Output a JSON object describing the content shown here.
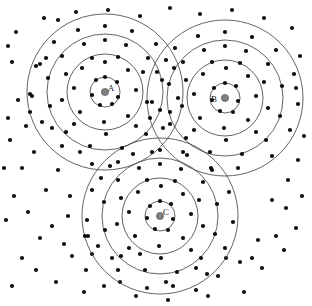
{
  "figure": {
    "width": 312,
    "height": 306,
    "background_color": "#ffffff",
    "ring_stroke_color": "#3c3c3c",
    "point_color": "#111111",
    "centroid_color": "#808080"
  },
  "chart_data": {
    "type": "scatter",
    "title": "",
    "xlabel": "",
    "ylabel": "",
    "xlim": [
      0,
      312
    ],
    "ylim": [
      0,
      306
    ],
    "grid": false,
    "legend": "none",
    "annotations": [
      "A",
      "B",
      "C"
    ],
    "clusters": [
      {
        "label": "A",
        "center": [
          105,
          92
        ],
        "centroid_color": "#808080",
        "centroid_radius": 3.6,
        "label_offset": [
          6,
          -3
        ],
        "ring_radii": [
          15,
          38,
          58,
          78
        ]
      },
      {
        "label": "B",
        "center": [
          225,
          98
        ],
        "centroid_color": "#808080",
        "centroid_radius": 3.6,
        "label_offset": [
          -11,
          2
        ],
        "ring_radii": [
          15,
          38,
          58,
          78
        ]
      },
      {
        "label": "C",
        "center": [
          160,
          216
        ],
        "centroid_color": "#808080",
        "centroid_radius": 3.6,
        "label_offset": [
          6,
          -3
        ],
        "ring_radii": [
          15,
          38,
          58,
          78
        ]
      }
    ],
    "cluster_points": {
      "A": [
        [
          105,
          77
        ],
        [
          96,
          80
        ],
        [
          117,
          82
        ],
        [
          92,
          95
        ],
        [
          118,
          97
        ],
        [
          100,
          105
        ],
        [
          112,
          104
        ],
        [
          82,
          68
        ],
        [
          105,
          62
        ],
        [
          128,
          70
        ],
        [
          74,
          88
        ],
        [
          136,
          90
        ],
        [
          80,
          112
        ],
        [
          104,
          122
        ],
        [
          128,
          116
        ],
        [
          92,
          58
        ],
        [
          118,
          57
        ],
        [
          66,
          74
        ],
        [
          143,
          72
        ],
        [
          62,
          100
        ],
        [
          147,
          102
        ],
        [
          74,
          124
        ],
        [
          106,
          134
        ],
        [
          136,
          126
        ],
        [
          105,
          40
        ],
        [
          84,
          44
        ],
        [
          126,
          45
        ],
        [
          62,
          56
        ],
        [
          148,
          58
        ],
        [
          48,
          78
        ],
        [
          162,
          80
        ],
        [
          50,
          106
        ],
        [
          160,
          110
        ],
        [
          66,
          132
        ],
        [
          146,
          134
        ],
        [
          90,
          146
        ],
        [
          122,
          148
        ],
        [
          105,
          26
        ],
        [
          78,
          30
        ],
        [
          132,
          31
        ],
        [
          54,
          42
        ],
        [
          156,
          44
        ],
        [
          36,
          66
        ],
        [
          174,
          68
        ],
        [
          32,
          96
        ],
        [
          178,
          98
        ],
        [
          42,
          122
        ],
        [
          170,
          124
        ],
        [
          62,
          146
        ],
        [
          152,
          152
        ],
        [
          92,
          164
        ],
        [
          118,
          162
        ],
        [
          30,
          112
        ],
        [
          46,
          58
        ]
      ],
      "B": [
        [
          225,
          83
        ],
        [
          214,
          88
        ],
        [
          236,
          86
        ],
        [
          212,
          100
        ],
        [
          238,
          101
        ],
        [
          220,
          111
        ],
        [
          233,
          112
        ],
        [
          203,
          74
        ],
        [
          226,
          68
        ],
        [
          248,
          76
        ],
        [
          194,
          94
        ],
        [
          256,
          96
        ],
        [
          200,
          118
        ],
        [
          224,
          128
        ],
        [
          248,
          120
        ],
        [
          212,
          62
        ],
        [
          240,
          63
        ],
        [
          186,
          80
        ],
        [
          264,
          82
        ],
        [
          182,
          106
        ],
        [
          268,
          108
        ],
        [
          194,
          130
        ],
        [
          226,
          140
        ],
        [
          256,
          132
        ],
        [
          225,
          46
        ],
        [
          204,
          50
        ],
        [
          246,
          51
        ],
        [
          183,
          62
        ],
        [
          268,
          64
        ],
        [
          169,
          84
        ],
        [
          282,
          86
        ],
        [
          170,
          112
        ],
        [
          280,
          116
        ],
        [
          186,
          138
        ],
        [
          266,
          140
        ],
        [
          210,
          152
        ],
        [
          242,
          154
        ],
        [
          225,
          32
        ],
        [
          198,
          36
        ],
        [
          252,
          37
        ],
        [
          175,
          48
        ],
        [
          276,
          50
        ],
        [
          157,
          72
        ],
        [
          294,
          74
        ],
        [
          152,
          102
        ],
        [
          298,
          104
        ],
        [
          163,
          128
        ],
        [
          290,
          130
        ],
        [
          183,
          152
        ],
        [
          272,
          156
        ],
        [
          212,
          170
        ],
        [
          238,
          168
        ],
        [
          150,
          118
        ],
        [
          166,
          60
        ]
      ],
      "C": [
        [
          160,
          201
        ],
        [
          150,
          206
        ],
        [
          171,
          204
        ],
        [
          147,
          218
        ],
        [
          173,
          219
        ],
        [
          155,
          229
        ],
        [
          168,
          230
        ],
        [
          138,
          192
        ],
        [
          161,
          186
        ],
        [
          183,
          194
        ],
        [
          129,
          212
        ],
        [
          191,
          214
        ],
        [
          135,
          236
        ],
        [
          159,
          246
        ],
        [
          183,
          238
        ],
        [
          147,
          180
        ],
        [
          175,
          181
        ],
        [
          121,
          198
        ],
        [
          199,
          200
        ],
        [
          117,
          224
        ],
        [
          203,
          226
        ],
        [
          129,
          248
        ],
        [
          161,
          258
        ],
        [
          191,
          250
        ],
        [
          160,
          164
        ],
        [
          139,
          168
        ],
        [
          181,
          169
        ],
        [
          118,
          180
        ],
        [
          203,
          182
        ],
        [
          104,
          202
        ],
        [
          217,
          204
        ],
        [
          105,
          230
        ],
        [
          215,
          234
        ],
        [
          121,
          256
        ],
        [
          201,
          258
        ],
        [
          145,
          270
        ],
        [
          177,
          272
        ],
        [
          160,
          150
        ],
        [
          133,
          154
        ],
        [
          187,
          155
        ],
        [
          110,
          166
        ],
        [
          211,
          168
        ],
        [
          92,
          190
        ],
        [
          229,
          192
        ],
        [
          87,
          220
        ],
        [
          233,
          222
        ],
        [
          98,
          246
        ],
        [
          225,
          248
        ],
        [
          118,
          270
        ],
        [
          207,
          274
        ],
        [
          147,
          288
        ],
        [
          173,
          286
        ],
        [
          85,
          236
        ],
        [
          101,
          178
        ]
      ]
    },
    "background_points": [
      [
        16,
        32
      ],
      [
        44,
        18
      ],
      [
        58,
        20
      ],
      [
        12,
        62
      ],
      [
        40,
        64
      ],
      [
        10,
        140
      ],
      [
        22,
        168
      ],
      [
        14,
        196
      ],
      [
        28,
        212
      ],
      [
        40,
        238
      ],
      [
        22,
        258
      ],
      [
        12,
        286
      ],
      [
        58,
        170
      ],
      [
        70,
        196
      ],
      [
        52,
        226
      ],
      [
        72,
        256
      ],
      [
        56,
        282
      ],
      [
        86,
        270
      ],
      [
        84,
        292
      ],
      [
        104,
        286
      ],
      [
        136,
        296
      ],
      [
        168,
        300
      ],
      [
        196,
        290
      ],
      [
        218,
        276
      ],
      [
        244,
        292
      ],
      [
        262,
        268
      ],
      [
        284,
        250
      ],
      [
        296,
        228
      ],
      [
        302,
        196
      ],
      [
        288,
        180
      ],
      [
        272,
        200
      ],
      [
        258,
        240
      ],
      [
        240,
        262
      ],
      [
        208,
        296
      ],
      [
        120,
        282
      ],
      [
        92,
        254
      ],
      [
        68,
        216
      ],
      [
        46,
        190
      ],
      [
        34,
        152
      ],
      [
        26,
        126
      ],
      [
        18,
        100
      ],
      [
        8,
        46
      ],
      [
        76,
        12
      ],
      [
        108,
        10
      ],
      [
        140,
        16
      ],
      [
        170,
        8
      ],
      [
        200,
        14
      ],
      [
        232,
        10
      ],
      [
        264,
        18
      ],
      [
        292,
        28
      ],
      [
        300,
        56
      ],
      [
        296,
        88
      ],
      [
        304,
        136
      ],
      [
        298,
        160
      ],
      [
        286,
        208
      ],
      [
        276,
        236
      ],
      [
        252,
        258
      ],
      [
        226,
        258
      ],
      [
        196,
        268
      ],
      [
        166,
        282
      ],
      [
        140,
        254
      ],
      [
        112,
        258
      ],
      [
        88,
        236
      ],
      [
        64,
        244
      ],
      [
        36,
        270
      ],
      [
        6,
        220
      ],
      [
        4,
        168
      ],
      [
        8,
        118
      ],
      [
        30,
        94
      ],
      [
        52,
        128
      ],
      [
        80,
        152
      ]
    ]
  }
}
